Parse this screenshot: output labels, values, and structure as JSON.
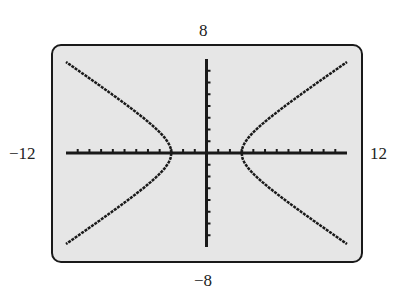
{
  "window": {
    "xmin": -12,
    "xmax": 12,
    "ymin": -8,
    "ymax": 8,
    "xscl": 1,
    "yscl": 1
  },
  "labels": {
    "ymax": "8",
    "ymin": "−8",
    "xmin": "−12",
    "xmax": "12"
  },
  "colors": {
    "screen_background": "#e6e6e6",
    "ink": "#1a1a1a"
  },
  "chart_data": {
    "type": "line",
    "title": "",
    "equation": "x^2/9 - y^2/4 = 1",
    "xlabel": "",
    "ylabel": "",
    "xlim": [
      -12,
      12
    ],
    "ylim": [
      -8,
      8
    ],
    "grid": false,
    "axes_ticks": {
      "x_step": 1,
      "y_step": 1
    },
    "series": [
      {
        "name": "right branch upper",
        "x": [
          3,
          4,
          5,
          6,
          7,
          8,
          9,
          10,
          11,
          12
        ],
        "y": [
          0,
          1.76,
          2.67,
          3.46,
          4.22,
          4.94,
          5.66,
          6.36,
          7.05,
          7.75
        ]
      },
      {
        "name": "right branch lower",
        "x": [
          3,
          4,
          5,
          6,
          7,
          8,
          9,
          10,
          11,
          12
        ],
        "y": [
          0,
          -1.76,
          -2.67,
          -3.46,
          -4.22,
          -4.94,
          -5.66,
          -6.36,
          -7.05,
          -7.75
        ]
      },
      {
        "name": "left branch upper",
        "x": [
          -3,
          -4,
          -5,
          -6,
          -7,
          -8,
          -9,
          -10,
          -11,
          -12
        ],
        "y": [
          0,
          1.76,
          2.67,
          3.46,
          4.22,
          4.94,
          5.66,
          6.36,
          7.05,
          7.75
        ]
      },
      {
        "name": "left branch lower",
        "x": [
          -3,
          -4,
          -5,
          -6,
          -7,
          -8,
          -9,
          -10,
          -11,
          -12
        ],
        "y": [
          0,
          -1.76,
          -2.67,
          -3.46,
          -4.22,
          -4.94,
          -5.66,
          -6.36,
          -7.05,
          -7.75
        ]
      }
    ],
    "annotations": [
      "8",
      "-8",
      "-12",
      "12"
    ]
  }
}
